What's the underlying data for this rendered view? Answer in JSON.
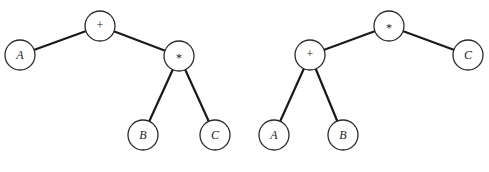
{
  "diagram": {
    "type": "expression-trees",
    "trees": [
      {
        "expression": "A + (B * C)",
        "nodes": [
          {
            "id": "plus",
            "label": "+",
            "kind": "op",
            "x": 100,
            "y": 26
          },
          {
            "id": "A",
            "label": "A",
            "kind": "var",
            "x": 20,
            "y": 55
          },
          {
            "id": "times",
            "label": "*",
            "kind": "op",
            "x": 179,
            "y": 56
          },
          {
            "id": "B",
            "label": "B",
            "kind": "var",
            "x": 143,
            "y": 135
          },
          {
            "id": "C",
            "label": "C",
            "kind": "var",
            "x": 215,
            "y": 135
          }
        ],
        "edges": [
          [
            "plus",
            "A"
          ],
          [
            "plus",
            "times"
          ],
          [
            "times",
            "B"
          ],
          [
            "times",
            "C"
          ]
        ]
      },
      {
        "expression": "(A + B) * C",
        "nodes": [
          {
            "id": "times",
            "label": "*",
            "kind": "op",
            "x": 389,
            "y": 26
          },
          {
            "id": "plus",
            "label": "+",
            "kind": "op",
            "x": 310,
            "y": 55
          },
          {
            "id": "C",
            "label": "C",
            "kind": "var",
            "x": 468,
            "y": 55
          },
          {
            "id": "A",
            "label": "A",
            "kind": "var",
            "x": 274,
            "y": 135
          },
          {
            "id": "B",
            "label": "B",
            "kind": "var",
            "x": 343,
            "y": 135
          }
        ],
        "edges": [
          [
            "times",
            "plus"
          ],
          [
            "times",
            "C"
          ],
          [
            "plus",
            "A"
          ],
          [
            "plus",
            "B"
          ]
        ]
      }
    ],
    "node_radius": 15
  }
}
